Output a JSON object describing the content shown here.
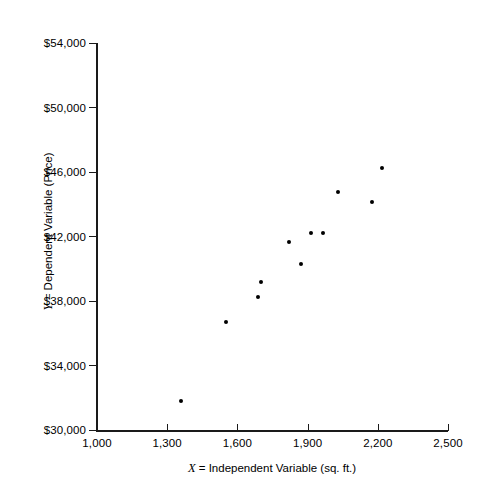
{
  "chart_data": {
    "type": "scatter",
    "title": "",
    "xlabel": "X  =  Independent Variable (sq. ft.)",
    "ylabel": "Y  =  Dependent Variable (Price)",
    "xlabel_parts": {
      "symbol": "X",
      "rest": "=  Independent Variable (sq. ft.)"
    },
    "ylabel_parts": {
      "symbol": "Y",
      "rest": "=  Dependent Variable (Price)"
    },
    "xlim": [
      1000,
      2500
    ],
    "ylim": [
      30000,
      54000
    ],
    "xticks": [
      1000,
      1300,
      1600,
      1900,
      2200,
      2500
    ],
    "yticks": [
      30000,
      34000,
      38000,
      42000,
      46000,
      50000,
      54000
    ],
    "xticklabels": [
      "1,000",
      "1,300",
      "1,600",
      "1,900",
      "2,200",
      "2,500"
    ],
    "yticklabels": [
      "$30,000",
      "$34,000",
      "$38,000",
      "$42,000",
      "$46,000",
      "$50,000",
      "$54,000"
    ],
    "grid": false,
    "legend": null,
    "marker": {
      "shape": "circle",
      "color": "#000000",
      "size": 4
    },
    "axis_color": "#1a1a1a",
    "background": "#ffffff",
    "x": [
      1360,
      1550,
      1690,
      1700,
      1820,
      1870,
      1915,
      1965,
      2030,
      2175,
      2220
    ],
    "y": [
      31800,
      36670,
      38230,
      39160,
      41650,
      40280,
      42220,
      42220,
      44770,
      44150,
      46270
    ],
    "points": [
      {
        "x": 1360,
        "y": 31800
      },
      {
        "x": 1550,
        "y": 36670
      },
      {
        "x": 1690,
        "y": 38230
      },
      {
        "x": 1700,
        "y": 39160
      },
      {
        "x": 1820,
        "y": 41650
      },
      {
        "x": 1870,
        "y": 40280
      },
      {
        "x": 1915,
        "y": 42220
      },
      {
        "x": 1965,
        "y": 42220
      },
      {
        "x": 2030,
        "y": 44770
      },
      {
        "x": 2175,
        "y": 44150
      },
      {
        "x": 2220,
        "y": 46270
      }
    ]
  },
  "plot_geometry": {
    "left_px": 97,
    "right_px": 448,
    "top_px": 43,
    "bottom_px": 430
  }
}
